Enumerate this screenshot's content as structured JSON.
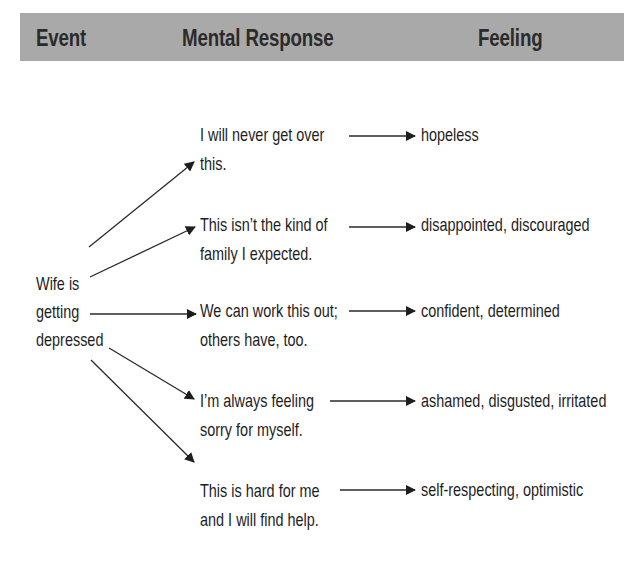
{
  "header": {
    "event": "Event",
    "mental_response": "Mental Response",
    "feeling": "Feeling",
    "background_color": "#a9a9a9"
  },
  "event": {
    "lines": [
      "Wife is",
      "getting",
      "depressed"
    ]
  },
  "rows": [
    {
      "response": [
        "I will never get over",
        "this."
      ],
      "feeling": "hopeless"
    },
    {
      "response": [
        "This isn’t the kind of",
        "family I expected."
      ],
      "feeling": "disappointed, discouraged"
    },
    {
      "response": [
        "We can work this out;",
        "others have, too."
      ],
      "feeling": "confident, determined"
    },
    {
      "response": [
        "I’m always feeling",
        "sorry for myself."
      ],
      "feeling": "ashamed, disgusted, irritated"
    },
    {
      "response": [
        "This is hard for me",
        "and I will find help."
      ],
      "feeling": "self-respecting, optimistic"
    }
  ]
}
